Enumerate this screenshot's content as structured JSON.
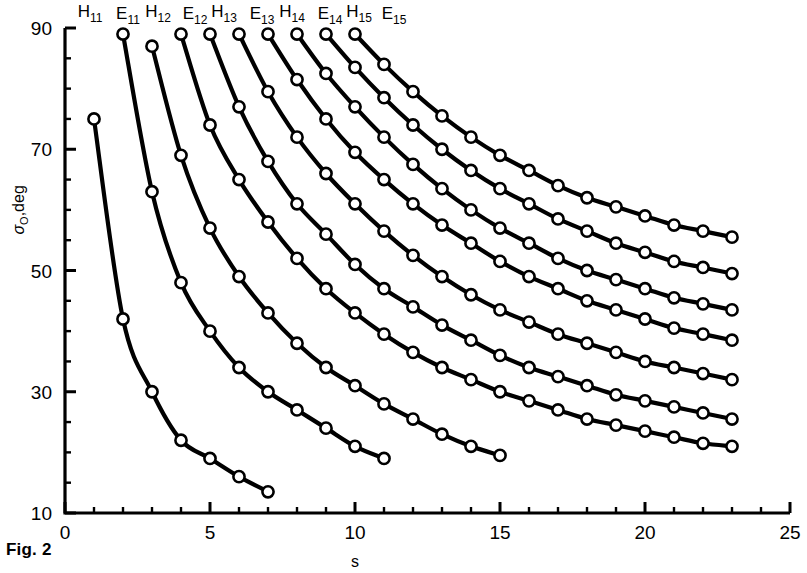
{
  "figure": {
    "caption": "Fig. 2"
  },
  "chart_data": {
    "type": "line",
    "title": "",
    "subtitle": "",
    "xlabel": "s",
    "ylabel": "σ₀,deg",
    "ylabel_main": "σ",
    "ylabel_sub": "O",
    "ylabel_tail": ",deg",
    "xlim": [
      0,
      25
    ],
    "ylim": [
      10,
      90
    ],
    "grid": false,
    "legend_position": "above-curves-inline",
    "x_major_ticks": [
      0,
      5,
      10,
      15,
      20,
      25
    ],
    "x_major_tick_labels": [
      "0",
      "5",
      "10",
      "15",
      "20",
      "25"
    ],
    "x_minor_tick_step": 1,
    "y_major_ticks": [
      10,
      30,
      50,
      70,
      90
    ],
    "y_major_tick_labels": [
      "10",
      "30",
      "50",
      "70",
      "90"
    ],
    "y_minor_tick_step": 5,
    "marker": "open-circle",
    "marker_face_color": "#ffffff",
    "line_color": "#000000",
    "series": [
      {
        "name": "H11",
        "label_base": "H",
        "label_sub": "11",
        "x": [
          1,
          2,
          3,
          4,
          5,
          6,
          7
        ],
        "y": [
          75,
          42,
          30,
          22,
          19,
          16,
          13.5
        ]
      },
      {
        "name": "E11",
        "label_base": "E",
        "label_sub": "11",
        "x": [
          2,
          3,
          4,
          5,
          6,
          7,
          8,
          9,
          10,
          11
        ],
        "y": [
          89,
          63,
          48,
          40,
          34,
          30,
          27,
          24,
          21,
          19
        ]
      },
      {
        "name": "H12",
        "label_base": "H",
        "label_sub": "12",
        "x": [
          3,
          4,
          5,
          6,
          7,
          8,
          9,
          10,
          11,
          12,
          13,
          14,
          15
        ],
        "y": [
          87,
          69,
          57,
          49,
          43,
          38,
          34,
          31,
          28,
          25.5,
          23,
          21,
          19.5
        ]
      },
      {
        "name": "E12",
        "label_base": "E",
        "label_sub": "12",
        "x": [
          4,
          5,
          6,
          7,
          8,
          9,
          10,
          11,
          12,
          13,
          14,
          15,
          16,
          17,
          18,
          19,
          20,
          21,
          22,
          23
        ],
        "y": [
          89,
          74,
          65,
          58,
          52,
          47,
          43,
          39.5,
          36.5,
          34,
          32,
          30,
          28.5,
          27,
          25.5,
          24.5,
          23.5,
          22.5,
          21.5,
          21
        ]
      },
      {
        "name": "H13",
        "label_base": "H",
        "label_sub": "13",
        "x": [
          5,
          6,
          7,
          8,
          9,
          10,
          11,
          12,
          13,
          14,
          15,
          16,
          17,
          18,
          19,
          20,
          21,
          22,
          23
        ],
        "y": [
          89,
          77,
          68,
          61,
          56,
          51,
          47,
          44,
          41,
          38.5,
          36,
          34,
          32.5,
          31,
          29.5,
          28.5,
          27.5,
          26.5,
          25.5
        ]
      },
      {
        "name": "E13",
        "label_base": "E",
        "label_sub": "13",
        "x": [
          6,
          7,
          8,
          9,
          10,
          11,
          12,
          13,
          14,
          15,
          16,
          17,
          18,
          19,
          20,
          21,
          22,
          23
        ],
        "y": [
          89,
          79.5,
          72,
          66,
          61,
          56.5,
          52.5,
          49,
          46,
          43.5,
          41.5,
          39.5,
          38,
          36.5,
          35,
          34,
          33,
          32
        ]
      },
      {
        "name": "H14",
        "label_base": "H",
        "label_sub": "14",
        "x": [
          7,
          8,
          9,
          10,
          11,
          12,
          13,
          14,
          15,
          16,
          17,
          18,
          19,
          20,
          21,
          22,
          23
        ],
        "y": [
          89,
          81.5,
          75,
          69.5,
          65,
          61,
          57.5,
          54.5,
          51.5,
          49,
          47,
          45,
          43.5,
          42,
          40.5,
          39.5,
          38.5
        ]
      },
      {
        "name": "E14",
        "label_base": "E",
        "label_sub": "14",
        "x": [
          8,
          9,
          10,
          11,
          12,
          13,
          14,
          15,
          16,
          17,
          18,
          19,
          20,
          21,
          22,
          23
        ],
        "y": [
          89,
          82.5,
          77,
          72,
          67.5,
          63.5,
          60,
          57,
          54.5,
          52,
          50,
          48.5,
          47,
          45.5,
          44.5,
          43.5
        ]
      },
      {
        "name": "H15",
        "label_base": "H",
        "label_sub": "15",
        "x": [
          9,
          10,
          11,
          12,
          13,
          14,
          15,
          16,
          17,
          18,
          19,
          20,
          21,
          22,
          23
        ],
        "y": [
          89,
          83.5,
          78.5,
          74,
          70,
          66.5,
          63.5,
          61,
          58.5,
          56.5,
          54.5,
          53,
          51.5,
          50.5,
          49.5
        ]
      },
      {
        "name": "E15",
        "label_base": "E",
        "label_sub": "15",
        "x": [
          10,
          11,
          12,
          13,
          14,
          15,
          16,
          17,
          18,
          19,
          20,
          21,
          22,
          23
        ],
        "y": [
          89,
          84,
          79.5,
          75.5,
          72,
          69,
          66.5,
          64,
          62,
          60.5,
          59,
          57.5,
          56.5,
          55.5
        ]
      }
    ],
    "curve_labels_order": [
      "H11",
      "E11",
      "H12",
      "E12",
      "H13",
      "E13",
      "H14",
      "E14",
      "H15",
      "E15"
    ]
  }
}
